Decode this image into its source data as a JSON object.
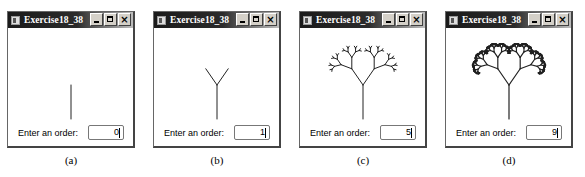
{
  "windows": [
    {
      "title": "Exercise18_38",
      "label": "Enter an order:",
      "order_value": "0",
      "order": 0,
      "caption": "(a)",
      "left": 7
    },
    {
      "title": "Exercise18_38",
      "label": "Enter an order:",
      "order_value": "1",
      "order": 1,
      "caption": "(b)",
      "left": 153
    },
    {
      "title": "Exercise18_38",
      "label": "Enter an order:",
      "order_value": "5",
      "order": 5,
      "caption": "(c)",
      "left": 299
    },
    {
      "title": "Exercise18_38",
      "label": "Enter an order:",
      "order_value": "9",
      "order": 9,
      "caption": "(d)",
      "left": 445
    }
  ],
  "title_buttons": {
    "minimize": "minimize-icon",
    "maximize": "maximize-icon",
    "close": "×"
  },
  "colors": {
    "tree": "#222222",
    "titlebar_start": "#1a1a1a",
    "titlebar_end": "#bdbdbd"
  }
}
